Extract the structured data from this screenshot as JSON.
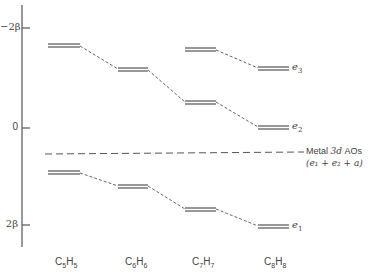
{
  "diagram": {
    "axis": {
      "ticks": [
        {
          "label": "−2β",
          "value": "-2beta",
          "y": 28
        },
        {
          "label": "0",
          "value": "0",
          "y": 128
        },
        {
          "label": "2β",
          "value": "2beta",
          "y": 225
        }
      ]
    },
    "molecules": [
      {
        "formula": "C5H5",
        "c": "C",
        "c_sub": "5",
        "h": "H",
        "h_sub": "5",
        "x": 55
      },
      {
        "formula": "C6H6",
        "c": "C",
        "c_sub": "6",
        "h": "H",
        "h_sub": "6",
        "x": 125
      },
      {
        "formula": "C7H7",
        "c": "C",
        "c_sub": "7",
        "h": "H",
        "h_sub": "7",
        "x": 192
      },
      {
        "formula": "C8H8",
        "c": "C",
        "c_sub": "8",
        "h": "H",
        "h_sub": "8",
        "x": 264
      }
    ],
    "levels": {
      "C5H5": {
        "upper_y": 45,
        "lower_y": 172
      },
      "C6H6": {
        "upper_y": 69,
        "lower_y": 186
      },
      "C7H7": {
        "upper_y": 49,
        "middle_y": 102,
        "lower_y": 209
      },
      "C8H8": {
        "e3_y": 68,
        "e2_y": 127,
        "e1_y": 226
      }
    },
    "symmetry_labels": [
      {
        "base": "e",
        "sub": "3",
        "y": 68
      },
      {
        "base": "e",
        "sub": "2",
        "y": 127
      },
      {
        "base": "e",
        "sub": "1",
        "y": 226
      }
    ],
    "metal": {
      "line1_prefix": "Metal",
      "line1_italic": "3d",
      "line1_suffix": "AOs",
      "line2": "(e₁ + e₂ + a)",
      "y": 154
    }
  }
}
